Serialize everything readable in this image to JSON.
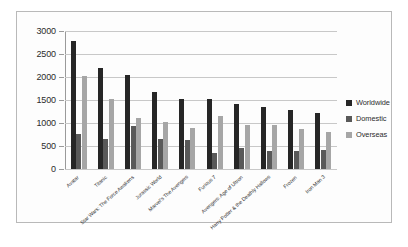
{
  "chart_data": {
    "type": "bar",
    "title": "",
    "subtitle": "",
    "xlabel": "",
    "ylabel": "",
    "ylim": [
      0,
      3000
    ],
    "ytick_labels": [
      "3000",
      "2500",
      "2000",
      "1500",
      "1000",
      "500",
      "0"
    ],
    "ytick_values": [
      3000,
      2500,
      2000,
      1500,
      1000,
      500,
      0
    ],
    "grid": true,
    "legend_position": "right",
    "categories": [
      "Avatar",
      "Titanic",
      "Star Wars: The Force Awakens",
      "Jurassic World",
      "Marvel's The Avengers",
      "Furious 7",
      "Avengers: Age of Ultron",
      "Harry Potter & the Deathly Hallows",
      "Frozen",
      "Iron Man 3"
    ],
    "series": [
      {
        "name": "Worldwide",
        "color": "#262626",
        "values": [
          2788,
          2187,
          2053,
          1672,
          1519,
          1516,
          1405,
          1342,
          1276,
          1215
        ]
      },
      {
        "name": "Domestic",
        "color": "#595959",
        "values": [
          761,
          659,
          937,
          652,
          623,
          353,
          459,
          381,
          401,
          409
        ]
      },
      {
        "name": "Overseas",
        "color": "#a6a6a6",
        "values": [
          2027,
          1528,
          1116,
          1019,
          895,
          1163,
          946,
          960,
          875,
          806
        ]
      }
    ]
  }
}
